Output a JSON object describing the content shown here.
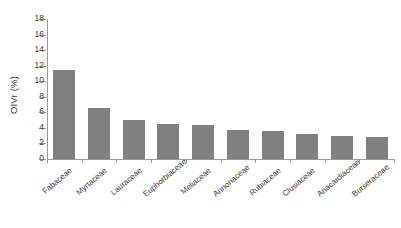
{
  "chart_data": {
    "type": "bar",
    "title": "",
    "xlabel": "",
    "ylabel": "OIVr (%)",
    "categories": [
      "Fabaceae",
      "Myrtaceae",
      "Lauraceae",
      "Euphorbiaceae",
      "Meliaceae",
      "Annonaceae",
      "Rubiaceae",
      "Clusiaceae",
      "Anacardiaceae",
      "Burseraceae"
    ],
    "values": [
      11.5,
      6.5,
      5.0,
      4.5,
      4.4,
      3.7,
      3.55,
      3.2,
      3.0,
      2.8
    ],
    "ylim": [
      0,
      18
    ],
    "ytick_step": 2,
    "yticks": [
      0,
      2,
      4,
      6,
      8,
      10,
      12,
      14,
      16,
      18
    ],
    "ytick_labels": [
      "0",
      "2",
      "4",
      "6",
      "8",
      "10",
      "12",
      "14",
      "16",
      "18"
    ],
    "grid": false,
    "legend": false,
    "bar_color": "#808080",
    "axis_color": "#9a9a9a",
    "background_color": "#ffffff",
    "series": [
      {
        "name": "OIVr",
        "values": [
          11.5,
          6.5,
          5.0,
          4.5,
          4.4,
          3.7,
          3.55,
          3.2,
          3.0,
          2.8
        ]
      }
    ]
  }
}
